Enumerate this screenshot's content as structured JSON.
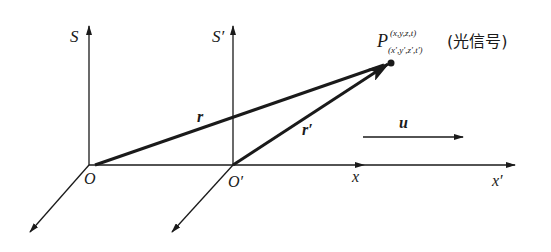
{
  "diagram": {
    "frames": [
      {
        "name": "S",
        "vertical_axis_label": "S",
        "origin_label": "O",
        "horizontal_axis_label": "x"
      },
      {
        "name": "S'",
        "vertical_axis_label": "S′",
        "origin_label": "O′",
        "horizontal_axis_label": "x′"
      }
    ],
    "vectors": {
      "r_label": "r",
      "r_prime_label": "r′",
      "velocity_label": "u"
    },
    "point": {
      "symbol": "P",
      "superscript": "(x,y,z,t)",
      "subscript": "(x′,y′,z′,t′)",
      "annotation": "(光信号)"
    }
  }
}
